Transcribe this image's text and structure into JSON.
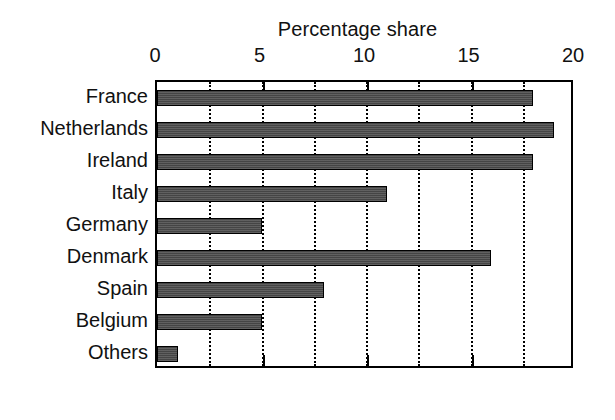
{
  "chart_data": {
    "type": "bar",
    "orientation": "horizontal",
    "title": "Percentage share",
    "xlabel": "",
    "ylabel": "",
    "xlim": [
      0,
      20
    ],
    "xticks": [
      0,
      5,
      10,
      15,
      20
    ],
    "xtick_labels": [
      "0",
      "5",
      "10",
      "15",
      "20"
    ],
    "gridlines": [
      0,
      2.5,
      5,
      7.5,
      10,
      12.5,
      15,
      17.5,
      20
    ],
    "grid": true,
    "grid_style": "dotted",
    "legend": null,
    "categories": [
      "France",
      "Netherlands",
      "Ireland",
      "Italy",
      "Germany",
      "Denmark",
      "Spain",
      "Belgium",
      "Others"
    ],
    "values": [
      18,
      19,
      18,
      11,
      5,
      16,
      8,
      5,
      1
    ],
    "bar_color": "#4d4d4d",
    "bar_edge_color": "#000000",
    "axis_color": "#000000",
    "background_color": "#ffffff"
  }
}
